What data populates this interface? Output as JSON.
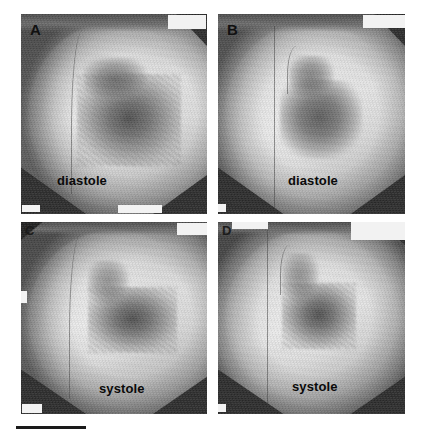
{
  "figure": {
    "kind": "left-ventriculogram-panel-figure",
    "background_color": "#ffffff",
    "width": 428,
    "height": 438,
    "modality": "cine ventriculography (fluoroscopic contrast angiogram)",
    "grid": "2 rows x 2 columns"
  },
  "panels": [
    {
      "id": "A",
      "letter": "A",
      "phase_label": "diastole",
      "row": 1,
      "column": 1,
      "annotations": [
        {
          "name": "top-right-overlay",
          "text": ""
        },
        {
          "name": "bottom-left-overlay",
          "text": ""
        },
        {
          "name": "bottom-center-overlay",
          "text": ""
        }
      ]
    },
    {
      "id": "B",
      "letter": "B",
      "phase_label": "diastole",
      "row": 1,
      "column": 2,
      "annotations": [
        {
          "name": "top-right-overlay",
          "text": ""
        },
        {
          "name": "bottom-left-overlay",
          "text": ""
        }
      ]
    },
    {
      "id": "C",
      "letter": "C",
      "phase_label": "systole",
      "row": 2,
      "column": 1,
      "annotations": [
        {
          "name": "top-right-overlay",
          "text": ""
        },
        {
          "name": "left-edge-overlay",
          "text": ""
        },
        {
          "name": "bottom-left-overlay",
          "text": ""
        }
      ]
    },
    {
      "id": "D",
      "letter": "D",
      "phase_label": "systole",
      "row": 2,
      "column": 2,
      "annotations": [
        {
          "name": "top-right-overlay-line-1",
          "text": ""
        },
        {
          "name": "top-right-overlay-line-2",
          "text": ""
        },
        {
          "name": "top-left-overlay",
          "text": ""
        },
        {
          "name": "bottom-left-overlay",
          "text": ""
        }
      ]
    }
  ],
  "scale_bar": {
    "name": "scale-bar",
    "caption": "",
    "color": "#1a1a1a"
  },
  "colors": {
    "page_background": "#ffffff",
    "label_text": "#0a0a0a",
    "overlay_box": "#f2f2f2",
    "collimator_shadow": "#2a2a2a",
    "scale_bar": "#1a1a1a"
  }
}
